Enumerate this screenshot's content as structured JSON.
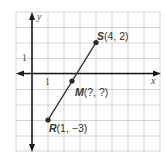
{
  "diagram": {
    "type": "coordinate-plane",
    "axes": {
      "x_label": "x",
      "y_label": "y",
      "x_tick_label": "1",
      "y_tick_label": "1",
      "x_range": [
        -1,
        8
      ],
      "y_range": [
        -5,
        4
      ]
    },
    "points": [
      {
        "name": "S",
        "label_name": "S",
        "label_coords": "(4, 2)",
        "x": 4,
        "y": 2
      },
      {
        "name": "M",
        "label_name": "M",
        "label_coords": "(?, ?)",
        "x": 2.5,
        "y": -0.5
      },
      {
        "name": "R",
        "label_name": "R",
        "label_coords": "(1, −3)",
        "x": 1,
        "y": -3
      }
    ],
    "segment": {
      "from": "R",
      "to": "S"
    },
    "colors": {
      "grid": "#c9c9c9",
      "axis": "#1a1a1a",
      "segment": "#2a2a2a",
      "text": "#333333",
      "background": "#ffffff"
    }
  }
}
